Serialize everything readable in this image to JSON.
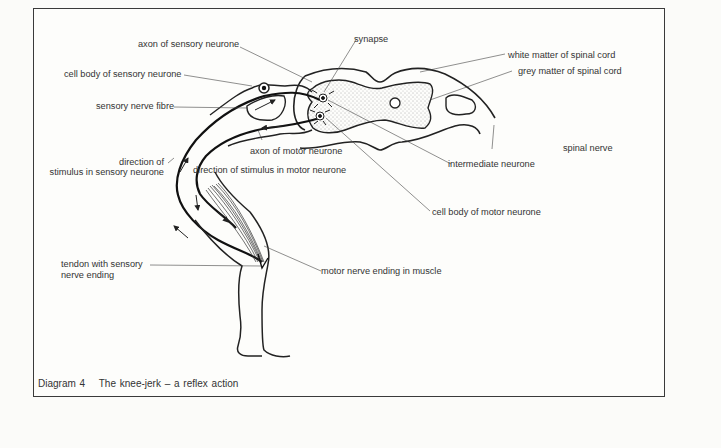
{
  "labels": {
    "axon_sensory": "axon of sensory neurone",
    "synapse": "synapse",
    "white_matter": "white matter of spinal cord",
    "grey_matter": "grey matter of spinal cord",
    "cell_body_sensory": "cell body of sensory neurone",
    "sensory_fibre": "sensory nerve fibre",
    "spinal_nerve": "spinal nerve",
    "axon_motor": "axon of motor neurone",
    "direction_sensory_l1": "direction of",
    "direction_sensory_l2": "stimulus in sensory neurone",
    "direction_motor": "direction of stimulus in motor neurone",
    "intermediate": "intermediate neurone",
    "cell_body_motor": "cell body of motor neurone",
    "tendon_l1": "tendon with sensory",
    "tendon_l2": "nerve ending",
    "motor_ending": "motor nerve ending in muscle"
  },
  "caption": {
    "number": "Diagram 4",
    "title": "The knee-jerk – a reflex action"
  }
}
